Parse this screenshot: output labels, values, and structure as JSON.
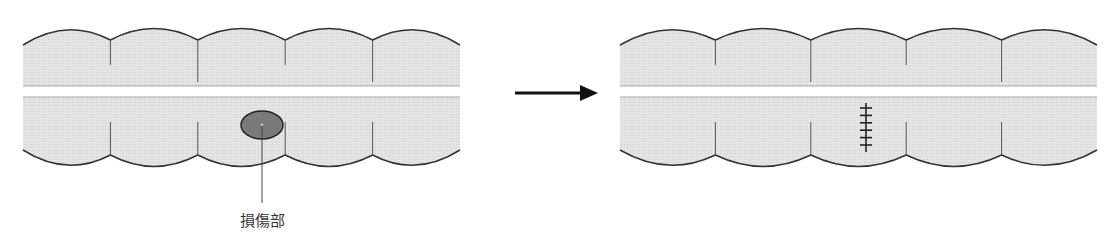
{
  "diagram": {
    "type": "surgical-repair-illustration",
    "panels": [
      {
        "id": "before",
        "description": "intestine with lesion",
        "segments": 5,
        "lesion": true,
        "label": "損傷部"
      },
      {
        "id": "after",
        "description": "intestine with sutured repair",
        "segments": 5,
        "suture_stitches": 6
      }
    ],
    "arrow": "right-arrow"
  },
  "colors": {
    "fill": "#e6e6e6",
    "outline": "#333333",
    "lesion": "#7a7a7a",
    "gap": "#ffffff"
  }
}
